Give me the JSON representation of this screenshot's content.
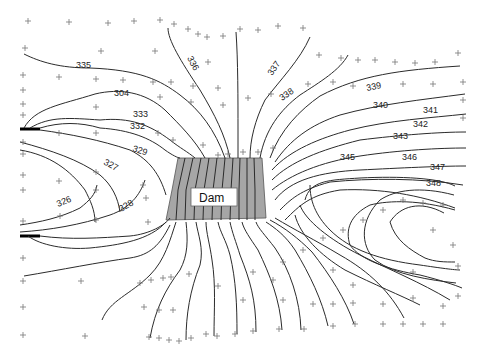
{
  "diagram": {
    "type": "contour-map",
    "subject": "Dam",
    "dam_label": "Dam",
    "dam_fill": "#a6a6a6",
    "line_color": "#2b2b2b",
    "point_color": "#777777",
    "contour_labels": {
      "c326": "326",
      "c327": "327",
      "c328": "328",
      "c329": "329",
      "c332": "332",
      "c333": "333",
      "c334": "304",
      "c335": "335",
      "c336": "336",
      "c337": "337",
      "c338": "338",
      "c339": "339",
      "c340": "340",
      "c341": "341",
      "c342": "342",
      "c343": "343",
      "c345": "345",
      "c346": "346",
      "c347": "347",
      "c348": "348"
    }
  }
}
